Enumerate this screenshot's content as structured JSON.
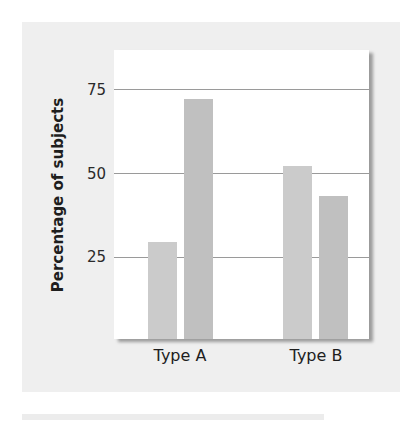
{
  "chart_data": {
    "type": "bar",
    "title": "",
    "xlabel": "",
    "ylabel": "Percentage of subjects",
    "categories": [
      "Type A",
      "Type B"
    ],
    "series": [
      {
        "name": "Series 1",
        "values": [
          29,
          52
        ]
      },
      {
        "name": "Series 2",
        "values": [
          72,
          43
        ]
      }
    ],
    "ylim": [
      0,
      80
    ],
    "yticks": [
      25,
      50,
      75
    ],
    "grid": true,
    "legend": "none",
    "colors": [
      "#cbcbcb",
      "#c0c0c0"
    ]
  },
  "axis": {
    "ylabel": "Percentage of subjects",
    "ticks": [
      "25",
      "50",
      "75"
    ],
    "categories": [
      "Type A",
      "Type B"
    ]
  }
}
